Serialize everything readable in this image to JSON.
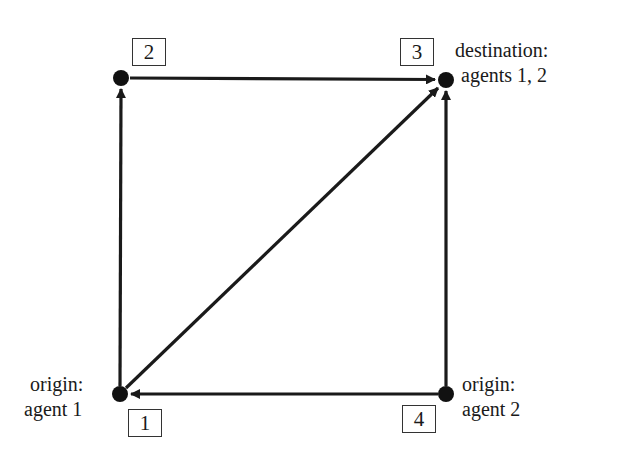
{
  "diagram": {
    "type": "network-graph",
    "colors": {
      "edge": "#1a1a1a",
      "node": "#111111",
      "box_border": "#333333",
      "text": "#1a1a1a"
    },
    "nodes": [
      {
        "id": 1,
        "label": "1",
        "x": 120,
        "y": 394
      },
      {
        "id": 2,
        "label": "2",
        "x": 121,
        "y": 78
      },
      {
        "id": 3,
        "label": "3",
        "x": 446,
        "y": 80
      },
      {
        "id": 4,
        "label": "4",
        "x": 446,
        "y": 394
      }
    ],
    "edges": [
      {
        "from": 1,
        "to": 2
      },
      {
        "from": 2,
        "to": 3
      },
      {
        "from": 1,
        "to": 3
      },
      {
        "from": 4,
        "to": 3
      },
      {
        "from": 4,
        "to": 1
      }
    ],
    "annotations": {
      "node3": {
        "line1": "destination:",
        "line2": "agents 1, 2"
      },
      "node1": {
        "line1": "origin:",
        "line2": "agent 1"
      },
      "node4": {
        "line1": "origin:",
        "line2": "agent 2"
      }
    }
  }
}
